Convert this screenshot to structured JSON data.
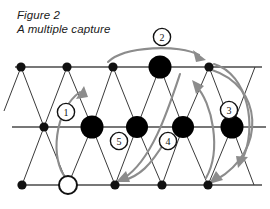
{
  "figure": {
    "caption_line1": "Figure 2",
    "caption_line2": "A multiple capture",
    "colors": {
      "background": "#ffffff",
      "lattice": "#3a3a3a",
      "arrow": "#8c8c8c",
      "piece_captured": "#000000",
      "piece_moving_fill": "#ffffff",
      "piece_moving_stroke": "#111111",
      "label_text": "#111111"
    },
    "board": {
      "type": "triangular-lattice",
      "rows": 3,
      "row_y": [
        67,
        127,
        185
      ],
      "columns_per_row": 5,
      "row_top_x": [
        21,
        67,
        113,
        160,
        209
      ],
      "row_mid_x": [
        44,
        92,
        137,
        183,
        232
      ],
      "row_bot_x": [
        22,
        68,
        115,
        162,
        208
      ]
    },
    "nodes": [
      {
        "id": "t1",
        "label": "top-left-vertex",
        "x": 21,
        "y": 67,
        "kind": "small"
      },
      {
        "id": "t2",
        "label": "top-vertex-2",
        "x": 67,
        "y": 67,
        "kind": "small"
      },
      {
        "id": "t3",
        "label": "top-vertex-3",
        "x": 113,
        "y": 67,
        "kind": "small"
      },
      {
        "id": "t4",
        "label": "top-captured-piece",
        "x": 160,
        "y": 67,
        "kind": "big"
      },
      {
        "id": "t5",
        "label": "top-right-vertex",
        "x": 209,
        "y": 67,
        "kind": "small"
      },
      {
        "id": "m1",
        "label": "mid-left-vertex",
        "x": 44,
        "y": 127,
        "kind": "small"
      },
      {
        "id": "m2",
        "label": "mid-captured-piece-1",
        "x": 92,
        "y": 127,
        "kind": "big"
      },
      {
        "id": "m3",
        "label": "mid-captured-piece-2",
        "x": 137,
        "y": 127,
        "kind": "big"
      },
      {
        "id": "m4",
        "label": "mid-captured-piece-3",
        "x": 183,
        "y": 127,
        "kind": "big"
      },
      {
        "id": "m5",
        "label": "mid-captured-piece-4",
        "x": 232,
        "y": 127,
        "kind": "big"
      },
      {
        "id": "b1",
        "label": "bottom-left-vertex",
        "x": 22,
        "y": 185,
        "kind": "small"
      },
      {
        "id": "b2",
        "label": "moving-piece-start",
        "x": 68,
        "y": 185,
        "kind": "open"
      },
      {
        "id": "b3",
        "label": "bottom-vertex-3",
        "x": 115,
        "y": 185,
        "kind": "small"
      },
      {
        "id": "b4",
        "label": "bottom-vertex-4",
        "x": 162,
        "y": 185,
        "kind": "small"
      },
      {
        "id": "b5",
        "label": "bottom-vertex-5",
        "x": 208,
        "y": 185,
        "kind": "small"
      }
    ],
    "move_labels": [
      {
        "n": "1",
        "x": 66,
        "y": 112
      },
      {
        "n": "2",
        "x": 162,
        "y": 37
      },
      {
        "n": "3",
        "x": 229,
        "y": 110
      },
      {
        "n": "4",
        "x": 168,
        "y": 141
      },
      {
        "n": "5",
        "x": 119,
        "y": 141
      }
    ],
    "capture_sequence": [
      "1",
      "2",
      "3",
      "4",
      "5"
    ],
    "move_count": 5
  }
}
